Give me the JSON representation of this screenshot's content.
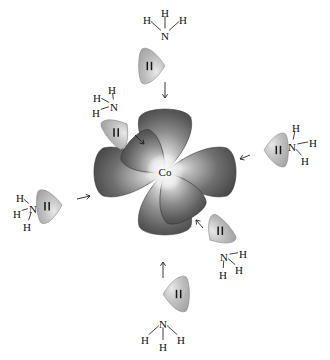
{
  "diagram": {
    "background_color": "#ffffff",
    "metal": {
      "symbol": "Co",
      "name": "cobalt-center",
      "x": 165,
      "y": 172,
      "orbital_count": 6,
      "orbital_fill_dark": "#4a4a4a",
      "orbital_fill_light": "#d8d8d8"
    },
    "orbitals": [
      {
        "name": "lobe-up",
        "angle": -90,
        "length": 62,
        "width": 30
      },
      {
        "name": "lobe-down",
        "angle": 90,
        "length": 62,
        "width": 30
      },
      {
        "name": "lobe-left",
        "angle": 180,
        "length": 70,
        "width": 28
      },
      {
        "name": "lobe-right",
        "angle": 0,
        "length": 70,
        "width": 28
      },
      {
        "name": "lobe-upper-left",
        "angle": -138,
        "length": 46,
        "width": 24
      },
      {
        "name": "lobe-lower-right",
        "angle": 62,
        "length": 52,
        "width": 26
      }
    ],
    "ligand_fill": "#b4b4b4",
    "lone_pair_symbol": "electron-pair-bars",
    "ligands": [
      {
        "name": "ammonia-top",
        "formula": "NH3",
        "nitrogen": "N",
        "hydrogens": [
          "H",
          "H",
          "H"
        ],
        "lobe": {
          "x": 165,
          "y": 66,
          "angle": 180,
          "length": 26,
          "width": 20
        },
        "nitrogen_pos": {
          "x": 165,
          "y": 36
        },
        "hydrogen_pos": [
          {
            "x": 147,
            "y": 20
          },
          {
            "x": 165,
            "y": 13
          },
          {
            "x": 183,
            "y": 20
          }
        ],
        "arrow": {
          "x1": 165,
          "y1": 82,
          "x2": 165,
          "y2": 98
        }
      },
      {
        "name": "ammonia-upper-left",
        "formula": "NH3",
        "nitrogen": "N",
        "hydrogens": [
          "H",
          "H",
          "H"
        ],
        "lobe": {
          "x": 127,
          "y": 124,
          "angle": 142,
          "length": 23,
          "width": 19
        },
        "nitrogen_pos": {
          "x": 114,
          "y": 107
        },
        "hydrogen_pos": [
          {
            "x": 112,
            "y": 90
          },
          {
            "x": 97,
            "y": 98
          },
          {
            "x": 96,
            "y": 113
          }
        ],
        "arrow": {
          "x1": 135,
          "y1": 135,
          "x2": 144,
          "y2": 144
        }
      },
      {
        "name": "ammonia-right",
        "formula": "NH3",
        "nitrogen": "N",
        "hydrogens": [
          "H",
          "H",
          "H"
        ],
        "lobe": {
          "x": 264,
          "y": 150,
          "angle": 0,
          "length": 24,
          "width": 19
        },
        "nitrogen_pos": {
          "x": 292,
          "y": 147
        },
        "hydrogen_pos": [
          {
            "x": 296,
            "y": 128
          },
          {
            "x": 313,
            "y": 143
          },
          {
            "x": 305,
            "y": 161
          }
        ],
        "arrow": {
          "x1": 250,
          "y1": 155,
          "x2": 240,
          "y2": 159
        }
      },
      {
        "name": "ammonia-left",
        "formula": "NH3",
        "nitrogen": "N",
        "hydrogens": [
          "H",
          "H",
          "H"
        ],
        "lobe": {
          "x": 62,
          "y": 205,
          "angle": 175,
          "length": 25,
          "width": 19
        },
        "nitrogen_pos": {
          "x": 33,
          "y": 209
        },
        "hydrogen_pos": [
          {
            "x": 20,
            "y": 198
          },
          {
            "x": 17,
            "y": 214
          },
          {
            "x": 27,
            "y": 227
          }
        ],
        "arrow": {
          "x1": 77,
          "y1": 199,
          "x2": 90,
          "y2": 196
        }
      },
      {
        "name": "ammonia-lower-right",
        "formula": "NH3",
        "nitrogen": "N",
        "hydrogens": [
          "H",
          "H",
          "H"
        ],
        "lobe": {
          "x": 210,
          "y": 240,
          "angle": -42,
          "length": 23,
          "width": 19
        },
        "nitrogen_pos": {
          "x": 224,
          "y": 257
        },
        "hydrogen_pos": [
          {
            "x": 243,
            "y": 254
          },
          {
            "x": 239,
            "y": 270
          },
          {
            "x": 223,
            "y": 275
          }
        ],
        "arrow": {
          "x1": 203,
          "y1": 228,
          "x2": 196,
          "y2": 220
        }
      },
      {
        "name": "ammonia-bottom",
        "formula": "NH3",
        "nitrogen": "N",
        "hydrogens": [
          "H",
          "H",
          "H"
        ],
        "lobe": {
          "x": 163,
          "y": 294,
          "angle": 0,
          "length": 26,
          "width": 20
        },
        "nitrogen_pos": {
          "x": 163,
          "y": 324
        },
        "hydrogen_pos": [
          {
            "x": 145,
            "y": 340
          },
          {
            "x": 163,
            "y": 347
          },
          {
            "x": 181,
            "y": 340
          }
        ],
        "arrow": {
          "x1": 163,
          "y1": 278,
          "x2": 163,
          "y2": 262
        }
      }
    ]
  }
}
